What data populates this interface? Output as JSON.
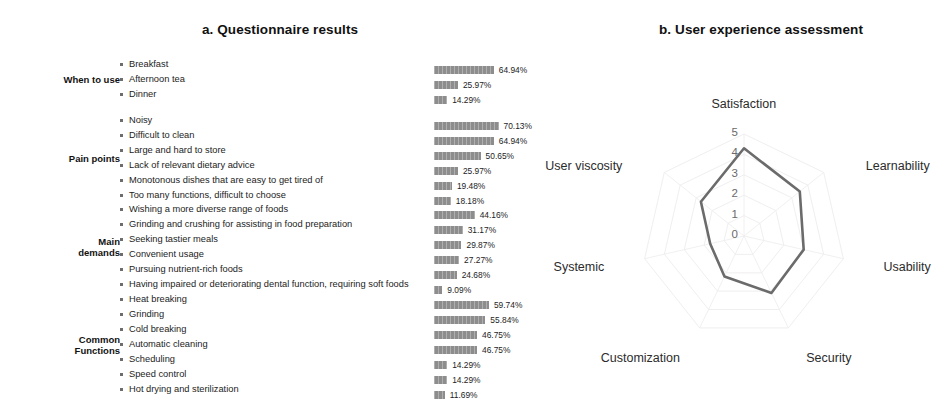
{
  "panel_a": {
    "title": "a. Questionnaire results",
    "groups": [
      {
        "label": "When to use",
        "items": [
          {
            "label": "Breakfast",
            "value": 64.94,
            "value_text": "64.94%"
          },
          {
            "label": "Afternoon tea",
            "value": 25.97,
            "value_text": "25.97%"
          },
          {
            "label": "Dinner",
            "value": 14.29,
            "value_text": "14.29%"
          }
        ]
      },
      {
        "label": "Pain points",
        "items": [
          {
            "label": "Noisy",
            "value": 70.13,
            "value_text": "70.13%"
          },
          {
            "label": "Difficult to clean",
            "value": 64.94,
            "value_text": "64.94%"
          },
          {
            "label": "Large and hard to store",
            "value": 50.65,
            "value_text": "50.65%"
          },
          {
            "label": "Lack of relevant dietary advice",
            "value": 25.97,
            "value_text": "25.97%"
          },
          {
            "label": "Monotonous dishes that are easy to get tired of",
            "value": 19.48,
            "value_text": "19.48%"
          },
          {
            "label": "Too many functions, difficult to choose",
            "value": 18.18,
            "value_text": "18.18%"
          }
        ]
      },
      {
        "label": "Main\ndemands",
        "items": [
          {
            "label": "Wishing a more diverse range of foods",
            "value": 44.16,
            "value_text": "44.16%"
          },
          {
            "label": "Grinding and crushing for assisting in food preparation",
            "value": 31.17,
            "value_text": "31.17%"
          },
          {
            "label": "Seeking tastier meals",
            "value": 29.87,
            "value_text": "29.87%"
          },
          {
            "label": "Convenient usage",
            "value": 27.27,
            "value_text": "27.27%"
          },
          {
            "label": "Pursuing nutrient-rich foods",
            "value": 24.68,
            "value_text": "24.68%"
          },
          {
            "label": "Having impaired or deteriorating dental function, requiring soft foods",
            "value": 9.09,
            "value_text": "9.09%"
          }
        ]
      },
      {
        "label": "Common\nFunctions",
        "items": [
          {
            "label": "Heat breaking",
            "value": 59.74,
            "value_text": "59.74%"
          },
          {
            "label": "Grinding",
            "value": 55.84,
            "value_text": "55.84%"
          },
          {
            "label": "Cold breaking",
            "value": 46.75,
            "value_text": "46.75%"
          },
          {
            "label": "Automatic cleaning",
            "value": 46.75,
            "value_text": "46.75%"
          },
          {
            "label": "Scheduling",
            "value": 14.29,
            "value_text": "14.29%"
          },
          {
            "label": "Speed control",
            "value": 14.29,
            "value_text": "14.29%"
          },
          {
            "label": "Hot drying and sterilization",
            "value": 11.69,
            "value_text": "11.69%"
          }
        ]
      }
    ]
  },
  "panel_b": {
    "title": "b. User experience assessment"
  },
  "chart_data": [
    {
      "type": "bar",
      "title": "a. Questionnaire results",
      "orientation": "horizontal",
      "xlabel": "",
      "ylabel": "",
      "xlim": [
        0,
        100
      ],
      "grid": false,
      "bar_color": "#8d8d8d",
      "value_suffix": "%",
      "categories": [
        "Breakfast",
        "Afternoon tea",
        "Dinner",
        "Noisy",
        "Difficult to clean",
        "Large and hard to store",
        "Lack of relevant dietary advice",
        "Monotonous dishes that are easy to get tired of",
        "Too many functions, difficult to choose",
        "Wishing a more diverse range of foods",
        "Grinding and crushing for assisting in food preparation",
        "Seeking tastier meals",
        "Convenient usage",
        "Pursuing nutrient-rich foods",
        "Having impaired or deteriorating dental function, requiring soft foods",
        "Heat breaking",
        "Grinding",
        "Cold breaking",
        "Automatic cleaning",
        "Scheduling",
        "Speed control",
        "Hot drying and sterilization"
      ],
      "values": [
        64.94,
        25.97,
        14.29,
        70.13,
        64.94,
        50.65,
        25.97,
        19.48,
        18.18,
        44.16,
        31.17,
        29.87,
        27.27,
        24.68,
        9.09,
        59.74,
        55.84,
        46.75,
        46.75,
        14.29,
        14.29,
        11.69
      ],
      "groups": [
        "When to use",
        "Pain points",
        "Main demands",
        "Common Functions"
      ]
    },
    {
      "type": "radar",
      "title": "b. User experience assessment",
      "categories": [
        "Satisfaction",
        "Learnability",
        "Usability",
        "Security",
        "Customization",
        "Systemic",
        "User viscosity"
      ],
      "values": [
        4.3,
        3.5,
        3.0,
        3.1,
        2.2,
        1.7,
        2.7
      ],
      "rlim": [
        0,
        5
      ],
      "rticks": [
        "0",
        "1",
        "2",
        "3",
        "4",
        "5"
      ],
      "grid": true,
      "line_color": "#6b6b6b",
      "legend": "none"
    }
  ]
}
